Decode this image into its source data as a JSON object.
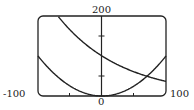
{
  "chart_data": {
    "type": "line",
    "title": "",
    "xlabel": "",
    "ylabel": "",
    "xlim": [
      -100,
      100
    ],
    "ylim": [
      0,
      200
    ],
    "x_tick_labels": [
      "-100",
      "0",
      "100"
    ],
    "y_tick_labels": [
      "200"
    ],
    "x_ticks": [
      -50,
      50
    ],
    "y_ticks": [
      50,
      150
    ],
    "grid": false,
    "series": [
      {
        "name": "decreasing curve",
        "x": [
          -68,
          -50,
          0,
          50,
          100
        ],
        "y": [
          198,
          165,
          100,
          61,
          37
        ]
      },
      {
        "name": "parabola",
        "x": [
          -100,
          -50,
          0,
          50,
          100
        ],
        "y": [
          100,
          25,
          0,
          25,
          100
        ]
      }
    ]
  },
  "labels": {
    "x_min": "-100",
    "x_max": "100",
    "x_zero": "0",
    "y_max": "200"
  }
}
